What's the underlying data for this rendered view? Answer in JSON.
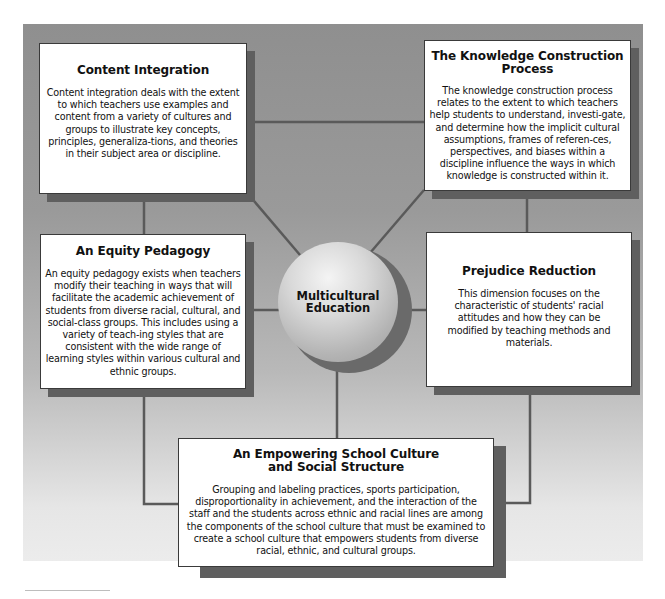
{
  "diagram": {
    "center": {
      "label_line1": "Multicultural",
      "label_line2": "Education"
    },
    "colors": {
      "background_top": "#8f8f8f",
      "background_bottom": "#ececec",
      "connector": "#5a5a5a",
      "box_fill": "#ffffff",
      "shadow": "#5f5f5f"
    },
    "dimensions": [
      {
        "id": "content-integration",
        "title": "Content Integration",
        "body": "Content integration deals with the extent to which teachers use examples and content from a variety of cultures and groups to illustrate key concepts, principles, generaliza-tions, and theories in their subject area or discipline."
      },
      {
        "id": "knowledge-construction",
        "title": "The Knowledge Construction Process",
        "body": "The knowledge construction process relates to the extent to which teachers help students to understand, investi-gate, and determine how the implicit cultural assumptions, frames of referen-ces, perspectives, and biases within a discipline influence the ways in which knowledge is constructed within it."
      },
      {
        "id": "equity-pedagogy",
        "title": "An Equity Pedagogy",
        "body": "An equity pedagogy exists when teachers modify their teaching in ways that will facilitate the academic achievement of students from diverse racial, cultural, and social-class groups. This includes using a variety of teach-ing styles that are consistent with the wide range of learning styles within various cultural and ethnic groups."
      },
      {
        "id": "prejudice-reduction",
        "title": "Prejudice Reduction",
        "body": "This dimension focuses on the characteristic of students' racial attitudes and how they can be modified by teaching methods and materials."
      },
      {
        "id": "empowering-school-culture",
        "title": "An Empowering School Culture and Social Structure",
        "body": "Grouping and labeling practices, sports participation, disproportionality in achievement, and the interaction of the staff and the students across ethnic and racial lines are among the components of the school culture that must be examined to create a school culture that empowers students from diverse racial, ethnic, and cultural groups."
      }
    ]
  }
}
